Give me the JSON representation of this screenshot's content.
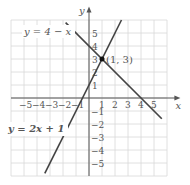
{
  "chart_data": {
    "type": "line",
    "title": "",
    "xlabel": "x",
    "ylabel": "y",
    "xlim": [
      -6,
      6
    ],
    "ylim": [
      -6,
      6
    ],
    "grid": true,
    "x_ticks": [
      "-5",
      "-4",
      "-3",
      "-2",
      "-1",
      "1",
      "2",
      "3",
      "4",
      "5"
    ],
    "y_ticks": [
      "5",
      "4",
      "3",
      "2",
      "1",
      "-1",
      "-2",
      "-3",
      "-4",
      "-5"
    ],
    "series": [
      {
        "name": "y = 4 − x",
        "slope": -1,
        "intercept": 4,
        "x_range": [
          -1.8,
          5.6
        ]
      },
      {
        "name": "y = 2x + 1",
        "slope": 2,
        "intercept": 1,
        "x_range": [
          -3.4,
          2.5
        ]
      }
    ],
    "annotations": [
      {
        "text": "(1, 3)",
        "x": 1,
        "y": 3,
        "marker": "point"
      }
    ],
    "labels": {
      "line1": "y = 4 − x",
      "line2": "y = 2x + 1",
      "point": "(1, 3)",
      "x_axis": "x",
      "y_axis": "y"
    },
    "colors": {
      "grid": "#d8d8d8",
      "axis": "#555555",
      "line": "#444444",
      "point": "#111111"
    }
  }
}
